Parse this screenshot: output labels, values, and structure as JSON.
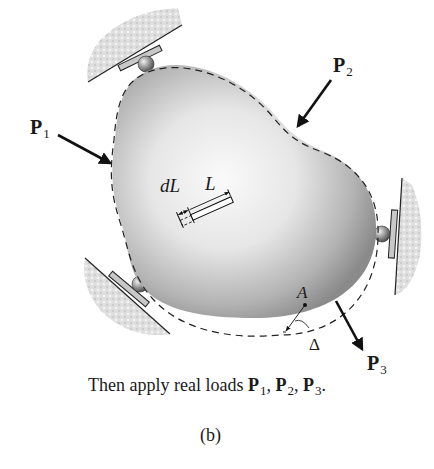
{
  "figure": {
    "panel_label": "(b)",
    "caption": {
      "prefix": "Then apply real loads ",
      "loads": [
        {
          "symbol": "P",
          "sub": "1",
          "sep": ", "
        },
        {
          "symbol": "P",
          "sub": "2",
          "sep": ", "
        },
        {
          "symbol": "P",
          "sub": "3",
          "sep": "."
        }
      ]
    },
    "loads": [
      {
        "symbol": "P",
        "sub": "1"
      },
      {
        "symbol": "P",
        "sub": "2"
      },
      {
        "symbol": "P",
        "sub": "3"
      }
    ],
    "element_labels": {
      "dL": "dL",
      "L": "L"
    },
    "point_label": "A",
    "displacement_label": "Δ",
    "colors": {
      "body_light": "#f7f7f7",
      "body_dark": "#8f8f8f",
      "outline": "#333333",
      "ground_hatch": "#cfcfcf",
      "arrow": "#111111"
    }
  }
}
